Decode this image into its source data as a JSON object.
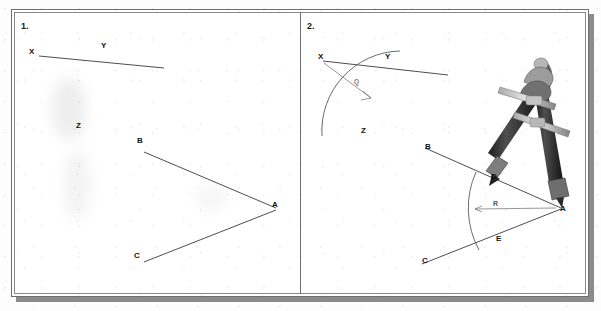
{
  "figure": {
    "panels": [
      {
        "number": "1.",
        "labels": [
          {
            "text": "X",
            "x": 32,
            "y": 52
          },
          {
            "text": "Y",
            "x": 104,
            "y": 47
          },
          {
            "text": "Z",
            "x": 79,
            "y": 126
          },
          {
            "text": "B",
            "x": 140,
            "y": 142
          },
          {
            "text": "A",
            "x": 275,
            "y": 205
          },
          {
            "text": "C",
            "x": 137,
            "y": 256
          }
        ]
      },
      {
        "number": "2.",
        "labels": [
          {
            "text": "X",
            "x": 321,
            "y": 57
          },
          {
            "text": "Y",
            "x": 388,
            "y": 57
          },
          {
            "text": "Z",
            "x": 364,
            "y": 131
          },
          {
            "text": "Q",
            "x": 356,
            "y": 81
          },
          {
            "text": "B",
            "x": 428,
            "y": 147
          },
          {
            "text": "D",
            "x": 494,
            "y": 177
          },
          {
            "text": "R",
            "x": 496,
            "y": 204
          },
          {
            "text": "A",
            "x": 563,
            "y": 209
          },
          {
            "text": "E",
            "x": 499,
            "y": 239
          },
          {
            "text": "C",
            "x": 425,
            "y": 261
          }
        ]
      }
    ],
    "tool": {
      "name": "drafting-compass",
      "position": "upper right of panel 2"
    }
  },
  "colors": {
    "paper": "#ffffff",
    "ink": "#3a3a3a",
    "frame": "#6e6e6e",
    "shadow": "#8b8b8b",
    "compass_dark": "#3d3d3d",
    "compass_light": "#9a9a9a",
    "faint_label": "#7a7a7a"
  }
}
